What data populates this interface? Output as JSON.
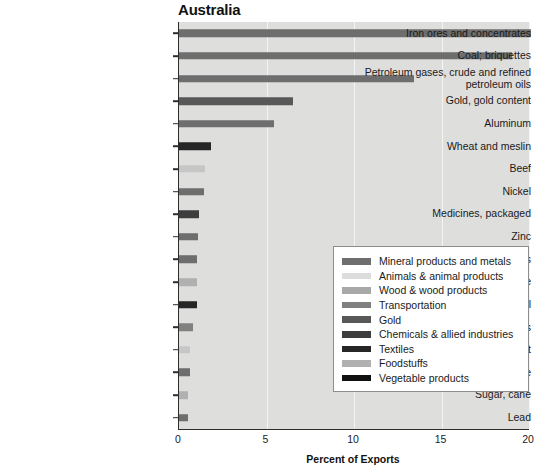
{
  "chart_data": {
    "type": "bar",
    "orientation": "horizontal",
    "title": "Australia",
    "xlabel": "Percent of Exports",
    "ylabel": "",
    "xlim": [
      0,
      20
    ],
    "xticks": [
      0,
      5,
      10,
      15,
      20
    ],
    "xtick_labels": [
      "0",
      "5",
      "10",
      "15",
      "20"
    ],
    "grid": true,
    "grid_axis": "x",
    "legend_position": "center-right",
    "categories": [
      "Iron ores and concentrates",
      "Coal; briquettes",
      "Petroleum gases, crude and refined\npetroleum oils",
      "Gold, gold content",
      "Aluminum",
      "Wheat and meslin",
      "Beef",
      "Nickel",
      "Medicines, packaged",
      "Zinc",
      "Copper and copper alloys",
      "Wine",
      "Wool",
      "Cars",
      "Lamb meat",
      "Manganese",
      "Sugar, cane",
      "Lead"
    ],
    "values": [
      20.1,
      19.0,
      13.4,
      6.5,
      5.4,
      1.8,
      1.5,
      1.4,
      1.15,
      1.1,
      1.05,
      1.0,
      1.0,
      0.8,
      0.65,
      0.6,
      0.5,
      0.5
    ],
    "bar_groups": [
      "Mineral products and metals",
      "Mineral products and metals",
      "Mineral products and metals",
      "Gold",
      "Mineral products and metals",
      "Vegetable products",
      "Animals & animal products",
      "Mineral products and metals",
      "Chemicals & allied industries",
      "Mineral products and metals",
      "Mineral products and metals",
      "Foodstuffs",
      "Textiles",
      "Transportation",
      "Animals & animal products",
      "Mineral products and metals",
      "Foodstuffs",
      "Mineral products and metals"
    ],
    "bar_colors": [
      "#6e6e6e",
      "#6e6e6e",
      "#6e6e6e",
      "#585858",
      "#6e6e6e",
      "#262626",
      "#c6c6c6",
      "#6e6e6e",
      "#3d3d3d",
      "#6e6e6e",
      "#6e6e6e",
      "#b0b0b0",
      "#262626",
      "#808080",
      "#c6c6c6",
      "#6e6e6e",
      "#b0b0b0",
      "#6e6e6e"
    ],
    "legend": [
      {
        "label": "Mineral products and metals",
        "color": "#6e6e6e"
      },
      {
        "label": "Animals & animal products",
        "color": "#dcdcdc"
      },
      {
        "label": "Wood & wood products",
        "color": "#a8a8a8"
      },
      {
        "label": "Transportation",
        "color": "#808080"
      },
      {
        "label": "Gold",
        "color": "#585858"
      },
      {
        "label": "Chemicals & allied industries",
        "color": "#3d3d3d"
      },
      {
        "label": "Textiles",
        "color": "#262626"
      },
      {
        "label": "Foodstuffs",
        "color": "#b0b0b0"
      },
      {
        "label": "Vegetable products",
        "color": "#111111"
      }
    ],
    "plot_background": "#dededd",
    "gridline_color": "#f4f4f3",
    "axis_color": "#2d2d2d"
  }
}
